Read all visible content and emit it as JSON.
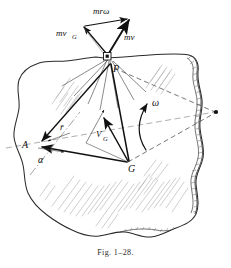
{
  "figure": {
    "caption_prefix": "Fig.",
    "caption_number": "1–28.",
    "caption_full": "Fig. 1–28."
  },
  "points": [
    {
      "id": "P",
      "label": "P",
      "x": 112,
      "y": 66
    },
    {
      "id": "G",
      "label": "G",
      "x": 130,
      "y": 163
    },
    {
      "id": "A",
      "label": "A",
      "x": 32,
      "y": 144
    },
    {
      "id": "axis",
      "label": "",
      "x": 217,
      "y": 112
    }
  ],
  "vectors": [
    {
      "id": "mr-omega",
      "label": "mrω",
      "label_x": 101,
      "label_y": 14,
      "from": "P",
      "dir": "up-left-to-up-right"
    },
    {
      "id": "mv-G",
      "label": "mv",
      "sub": "G",
      "label_x": 67,
      "label_y": 35,
      "from": "P",
      "dir": "up-left"
    },
    {
      "id": "mv",
      "label": "mv",
      "sub": "",
      "label_x": 127,
      "label_y": 38,
      "from": "P",
      "dir": "up-right"
    },
    {
      "id": "V-G",
      "label": "V",
      "sub": "G",
      "label_x": 98,
      "label_y": 133,
      "from": "G",
      "dir": "up-left"
    },
    {
      "id": "r-bar",
      "label": "r̄",
      "label_x": 63,
      "label_y": 130,
      "from": "A",
      "dir": "to-P"
    },
    {
      "id": "alpha",
      "label": "α",
      "label_x": 42,
      "label_y": 161,
      "from": "A",
      "dir": "angle"
    },
    {
      "id": "omega",
      "label": "ω",
      "label_x": 157,
      "label_y": 104,
      "from": "axis",
      "dir": "rotation"
    }
  ],
  "labels": {
    "mr_omega": "mrω",
    "mv_G_main": "mv",
    "mv_G_sub": "G",
    "mv": "mv",
    "V_main": "V",
    "V_sub": "G",
    "r_bar": "r̄",
    "alpha": "α",
    "omega": "ω",
    "point_P": "P",
    "point_G": "G",
    "point_A": "A"
  },
  "colors": {
    "ink": "#111111",
    "outline": "#2b2b2b",
    "hatch": "#9a9a9a",
    "edge_shade": "#777777",
    "background": "#ffffff"
  }
}
